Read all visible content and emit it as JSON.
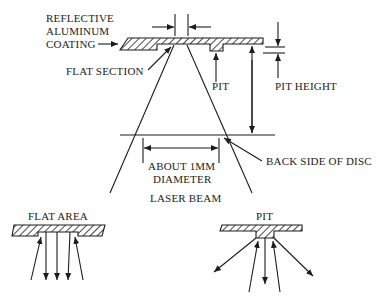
{
  "diagram": {
    "main": {
      "labels": {
        "coating_line1": "REFLECTIVE",
        "coating_line2": "ALUMINUM",
        "coating_line3": "COATING",
        "flat_section": "FLAT SECTION",
        "pit": "PIT",
        "pit_height": "PIT HEIGHT",
        "diameter_line1": "ABOUT 1MM",
        "diameter_line2": "DIAMETER",
        "back_side": "BACK SIDE OF DISC",
        "laser_beam": "LASER BEAM"
      }
    },
    "flat_area_detail": {
      "label": "FLAT AREA"
    },
    "pit_detail": {
      "label": "PIT"
    }
  },
  "colors": {
    "ink": "#1c1c1c",
    "background": "#ffffff"
  }
}
